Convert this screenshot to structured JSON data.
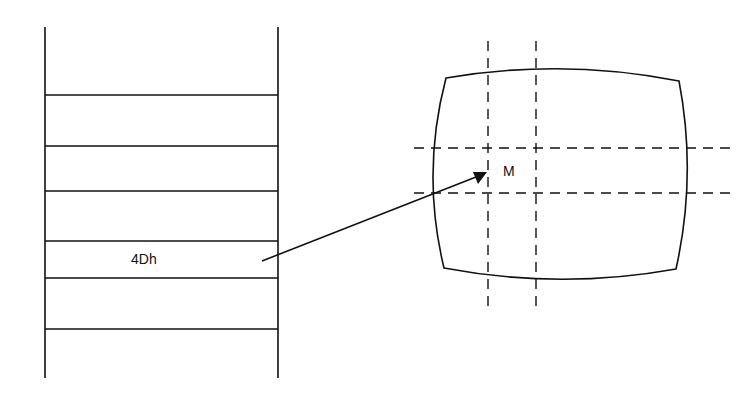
{
  "diagram": {
    "memory_table": {
      "rows": 7,
      "highlighted_cell_label": "4Dh"
    },
    "screen": {
      "point_label": "M"
    },
    "colors": {
      "line": "#111111",
      "background": "#ffffff"
    }
  }
}
